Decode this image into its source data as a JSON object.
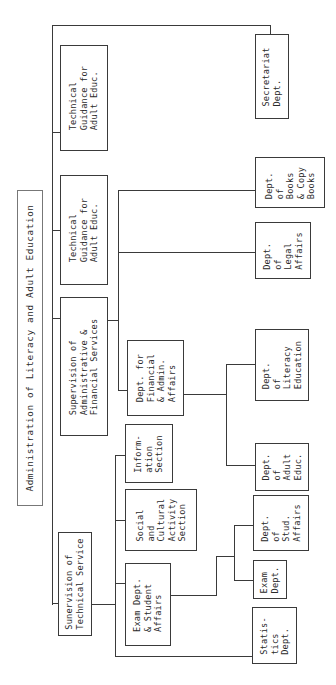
{
  "title": "Administration of Literacy and Adult Education",
  "nodes": {
    "technical_guidance_1": "Technical\nGuidance for\nAdult Educ.",
    "technical_guidance_2": "Technical\nGuidance for\nAdult Educ.",
    "supervision_admin": "Supervision of\nAdministrative &\nFinancial Services",
    "supervision_technical": "Sunervision of\nTechnical Service",
    "information_section": "Inform-\nation\nSection",
    "social_cultural_section": "Social\nand\nCultural\nActivity\nSection",
    "exam_student_affairs": "Exam Dept.\n& Student\nAffairs",
    "dept_financial_admin": "Dept. for\nFinancial\n& Admin.\nAffairs",
    "statistics_dept": "Statis-\ntics\nDept.",
    "exam_dept": "Exam\nDept.",
    "dept_student_affairs": "Dept.\nof\nStud.\nAffairs",
    "dept_adult_educ": "Dept.\nof\nAdult\nEduc.",
    "dept_literacy_education": "Dept.\nof\nLiteracy\nEducation",
    "dept_legal_affairs": "Dept.\nof\nLegal\nAffairs",
    "dept_books_copy_books": "Dept.\nof\nBooks\n& Copy\nBooks",
    "secretariat_dept": "Secretariat\nDept."
  },
  "colors": {
    "line": "#3a3a3a",
    "background": "#ffffff",
    "text": "#2a2a2a"
  }
}
